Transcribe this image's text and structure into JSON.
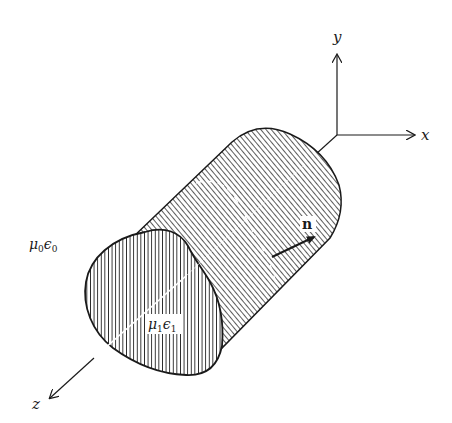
{
  "diagram": {
    "type": "3D cylinder with coordinate axes",
    "axes": {
      "x_label": "x",
      "y_label": "y",
      "z_label": "z"
    },
    "labels": {
      "outer_medium": {
        "mu": "μ",
        "mu_sub": "0",
        "eps": "ϵ",
        "eps_sub": "0"
      },
      "inner_medium": {
        "mu": "μ",
        "mu_sub": "1",
        "eps": "ϵ",
        "eps_sub": "1"
      },
      "normal_vector": "n"
    },
    "colors": {
      "ink": "#1a1a1a",
      "background": "#ffffff"
    }
  }
}
